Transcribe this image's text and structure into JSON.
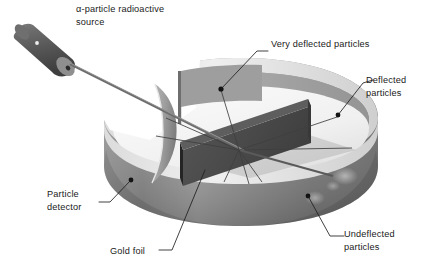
{
  "figure": {
    "background_color": "#ffffff",
    "ink_color": "#1a1a1a"
  },
  "labels": {
    "source": "α-particle radioactive\nsource",
    "very_deflected": "Very deflected particles",
    "deflected": "Deflected\nparticles",
    "undeflected": "Undeflected\nparticles",
    "particle_detector": "Particle\ndetector",
    "gold_foil": "Gold foil"
  },
  "parts": {
    "source_cylinder": {
      "name": "alpha-particle radioactive source",
      "body_color": "#5d5d5d",
      "end_cap_color": "#8d8d8d",
      "highlight_color": "#e8e8e8"
    },
    "detector_ring": {
      "name": "circular particle detector (zinc sulfide screen ring)",
      "top_rim_color": "#e2e2e2",
      "outer_wall_color": "#8e8e8e",
      "inner_wall_far_color": "#7a7a7a",
      "inner_floor_color": "#f2f2f2",
      "shadow_color": "#6b6b6b"
    },
    "gold_foil_plate": {
      "name": "gold foil target",
      "face_color": "#4a4a4a",
      "edge_color": "#2c2c2c"
    },
    "beam": {
      "name": "collimated alpha-particle beam",
      "color": "#6e6e6e"
    },
    "scatter_rays": {
      "name": "scattered alpha-particle trajectories",
      "color": "#4a4a4a",
      "count": 7
    },
    "impact_markers": {
      "name": "particle impact dots on detector",
      "color": "#111111",
      "count": 4
    }
  },
  "markers": [
    {
      "id": "very-deflected-impact",
      "x": 221,
      "y": 89
    },
    {
      "id": "deflected-impact",
      "x": 338,
      "y": 115
    },
    {
      "id": "particle-detector-point",
      "x": 131,
      "y": 180
    },
    {
      "id": "undeflected-impact",
      "x": 308,
      "y": 196
    }
  ]
}
